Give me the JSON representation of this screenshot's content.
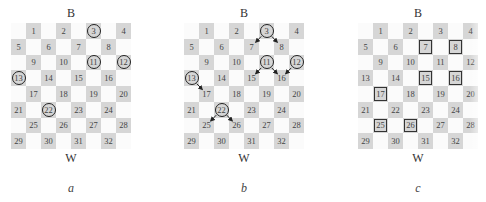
{
  "boards": [
    {
      "id": "a",
      "top_label": "B",
      "bottom_label": "W",
      "caption": "a",
      "circled": [
        3,
        11,
        12,
        13,
        22
      ],
      "boxed": [],
      "arrows": []
    },
    {
      "id": "b",
      "top_label": "B",
      "bottom_label": "W",
      "caption": "b",
      "circled": [
        3,
        11,
        12,
        13,
        22
      ],
      "boxed": [],
      "arrows": [
        {
          "from": 3,
          "to": 7
        },
        {
          "from": 3,
          "to": 8
        },
        {
          "from": 11,
          "to": 15
        },
        {
          "from": 11,
          "to": 16
        },
        {
          "from": 12,
          "to": 16
        },
        {
          "from": 13,
          "to": 17
        },
        {
          "from": 22,
          "to": 25
        },
        {
          "from": 22,
          "to": 26
        }
      ]
    },
    {
      "id": "c",
      "top_label": "B",
      "bottom_label": "W",
      "caption": "c",
      "circled": [],
      "boxed": [
        7,
        8,
        15,
        16,
        17,
        25,
        26
      ],
      "arrows": []
    }
  ],
  "square_numbers": [
    1,
    2,
    3,
    4,
    5,
    6,
    7,
    8,
    9,
    10,
    11,
    12,
    13,
    14,
    15,
    16,
    17,
    18,
    19,
    20,
    21,
    22,
    23,
    24,
    25,
    26,
    27,
    28,
    29,
    30,
    31,
    32
  ],
  "colors": {
    "dark_square": "#d6d6d6",
    "light_square": "#fbfbfb",
    "marker": "#222222"
  }
}
